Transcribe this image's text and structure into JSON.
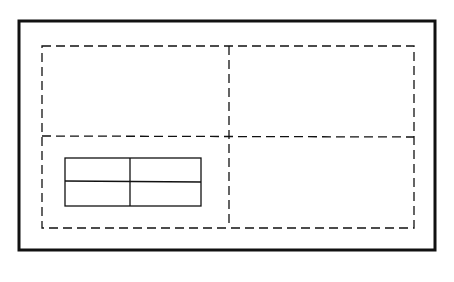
{
  "diagram": {
    "stroke_color": "#111111",
    "background_color": "#ffffff",
    "grid": {
      "rows": 2,
      "cols": 2,
      "line_style": "dashed"
    },
    "table": {
      "rows": 2,
      "cols": 2,
      "line_style": "solid",
      "region": "bottom-left"
    }
  }
}
